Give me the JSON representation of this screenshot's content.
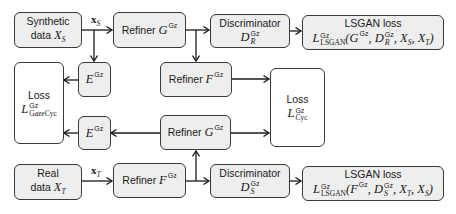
{
  "diagram": {
    "nodes": {
      "synthetic_data": {
        "line1": "Synthetic",
        "line2_text": "data ",
        "line2_math": "X",
        "line2_sub": "S"
      },
      "real_data": {
        "line1": "Real",
        "line2_text": "data ",
        "line2_math": "X",
        "line2_sub": "T"
      },
      "refiner_g_top": {
        "text": "Refiner ",
        "math": "G",
        "sup": "Gz"
      },
      "refiner_f_mid": {
        "text": "Refiner ",
        "math": "F",
        "sup": "Gz"
      },
      "refiner_g_bottom": {
        "text": "Refiner ",
        "math": "G",
        "sup": "Gz"
      },
      "refiner_f_bottom": {
        "text": "Refiner ",
        "math": "F",
        "sup": "Gz"
      },
      "encoder_top": {
        "math": "E",
        "sup": "Gz"
      },
      "encoder_bottom": {
        "math": "E",
        "sup": "Gz"
      },
      "discriminator_r": {
        "title": "Discriminator",
        "math": "D",
        "sup": "Gz",
        "sub": "R"
      },
      "discriminator_s": {
        "title": "Discriminator",
        "math": "D",
        "sup": "Gz",
        "sub": "S"
      },
      "loss_gazecyc": {
        "title": "Loss",
        "math": "L",
        "sup": "Gz",
        "sub": "GazeCyc"
      },
      "loss_cyc": {
        "title": "Loss",
        "math": "L",
        "sup": "Gz",
        "sub": "Cyc"
      },
      "lsgan_top": {
        "title": "LSGAN loss",
        "math": "L",
        "sup": "Gz",
        "sub": "LSGAN",
        "args": "(G",
        "args_sup1": "Gz",
        "args_mid": ", D",
        "args_sup2": "Gz",
        "args_sub2": "R",
        "args_tail": ", X",
        "args_sub3": "S",
        "args_tail2": ", X",
        "args_sub4": "T",
        "args_close": ")"
      },
      "lsgan_bottom": {
        "title": "LSGAN loss",
        "math": "L",
        "sup": "Gz",
        "sub": "LSGAN",
        "args": "(F",
        "args_sup1": "Gz",
        "args_mid": ", D",
        "args_sup2": "Gz",
        "args_sub2": "S",
        "args_tail": ", X",
        "args_sub3": "T",
        "args_tail2": ", X",
        "args_sub4": "S",
        "args_close": ")"
      }
    },
    "edge_labels": {
      "xs": {
        "math": "x",
        "sub": "S"
      },
      "xt": {
        "math": "x",
        "sub": "T"
      }
    },
    "colors": {
      "box_fill": "#eeeeee",
      "loss_fill": "#ffffff",
      "stroke": "#3a3a3a"
    }
  }
}
